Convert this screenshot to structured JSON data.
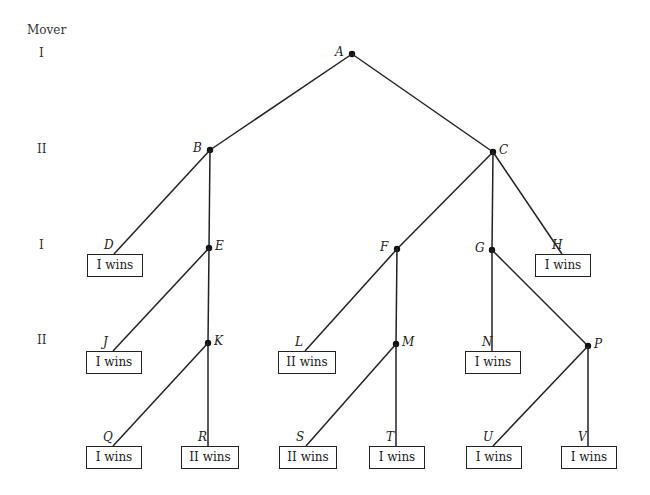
{
  "diagram": {
    "type": "game-tree",
    "mover_header": "Mover",
    "levels": [
      {
        "mover": "I"
      },
      {
        "mover": "II"
      },
      {
        "mover": "I"
      },
      {
        "mover": "II"
      },
      {
        "mover": ""
      }
    ],
    "nodes": [
      {
        "id": "A",
        "label": "A",
        "level": 0,
        "kind": "decision"
      },
      {
        "id": "B",
        "label": "B",
        "level": 1,
        "kind": "decision",
        "parent": "A"
      },
      {
        "id": "C",
        "label": "C",
        "level": 1,
        "kind": "decision",
        "parent": "A"
      },
      {
        "id": "D",
        "label": "D",
        "level": 2,
        "kind": "terminal",
        "parent": "B",
        "outcome": "I wins"
      },
      {
        "id": "E",
        "label": "E",
        "level": 2,
        "kind": "decision",
        "parent": "B"
      },
      {
        "id": "F",
        "label": "F",
        "level": 2,
        "kind": "decision",
        "parent": "C"
      },
      {
        "id": "G",
        "label": "G",
        "level": 2,
        "kind": "decision",
        "parent": "C"
      },
      {
        "id": "H",
        "label": "H",
        "level": 2,
        "kind": "terminal",
        "parent": "C",
        "outcome": "I wins"
      },
      {
        "id": "J",
        "label": "J",
        "level": 3,
        "kind": "terminal",
        "parent": "E",
        "outcome": "I wins"
      },
      {
        "id": "K",
        "label": "K",
        "level": 3,
        "kind": "decision",
        "parent": "E"
      },
      {
        "id": "L",
        "label": "L",
        "level": 3,
        "kind": "terminal",
        "parent": "F",
        "outcome": "II wins"
      },
      {
        "id": "M",
        "label": "M",
        "level": 3,
        "kind": "decision",
        "parent": "F"
      },
      {
        "id": "N",
        "label": "N",
        "level": 3,
        "kind": "terminal",
        "parent": "G",
        "outcome": "I wins"
      },
      {
        "id": "P",
        "label": "P",
        "level": 3,
        "kind": "decision",
        "parent": "G"
      },
      {
        "id": "Q",
        "label": "Q",
        "level": 4,
        "kind": "terminal",
        "parent": "K",
        "outcome": "I wins"
      },
      {
        "id": "R",
        "label": "R",
        "level": 4,
        "kind": "terminal",
        "parent": "K",
        "outcome": "II wins"
      },
      {
        "id": "S",
        "label": "S",
        "level": 4,
        "kind": "terminal",
        "parent": "M",
        "outcome": "II wins"
      },
      {
        "id": "T",
        "label": "T",
        "level": 4,
        "kind": "terminal",
        "parent": "M",
        "outcome": "I wins"
      },
      {
        "id": "U",
        "label": "U",
        "level": 4,
        "kind": "terminal",
        "parent": "P",
        "outcome": "I wins"
      },
      {
        "id": "V",
        "label": "V",
        "level": 4,
        "kind": "terminal",
        "parent": "P",
        "outcome": "I wins"
      }
    ]
  }
}
